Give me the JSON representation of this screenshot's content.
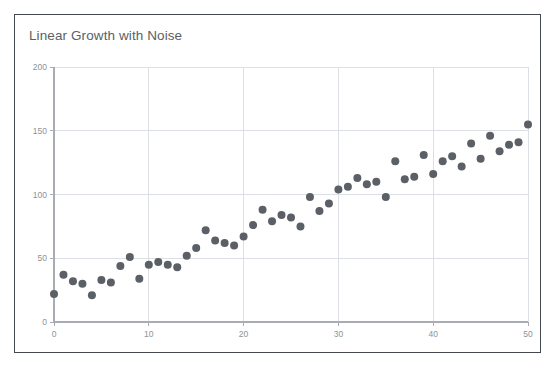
{
  "card": {
    "border_color": "#444851",
    "background": "#ffffff"
  },
  "chart_data": {
    "type": "scatter",
    "title": "Linear Growth with Noise",
    "xlabel": "",
    "ylabel": "",
    "xlim": [
      0,
      50
    ],
    "ylim": [
      0,
      200
    ],
    "grid": true,
    "legend": null,
    "marker_color": "#5b5f66",
    "marker_size": 4,
    "xticks": [
      0,
      10,
      20,
      30,
      40,
      50
    ],
    "yticks": [
      0,
      50,
      100,
      150,
      200
    ],
    "xtick_labels": [
      "0",
      "10",
      "20",
      "30",
      "40",
      "50"
    ],
    "ytick_labels": [
      "0",
      "50",
      "100",
      "150",
      "200"
    ],
    "x": [
      0,
      1,
      2,
      3,
      4,
      5,
      6,
      7,
      8,
      9,
      10,
      11,
      12,
      13,
      14,
      15,
      16,
      17,
      18,
      19,
      20,
      21,
      22,
      23,
      24,
      25,
      26,
      27,
      28,
      29,
      30,
      31,
      32,
      33,
      34,
      35,
      36,
      37,
      38,
      39,
      40,
      41,
      42,
      43,
      44,
      45,
      46,
      47,
      48,
      49,
      50
    ],
    "y": [
      22,
      37,
      32,
      30,
      21,
      33,
      31,
      44,
      51,
      34,
      45,
      47,
      45,
      43,
      52,
      58,
      72,
      64,
      62,
      60,
      67,
      76,
      88,
      79,
      84,
      82,
      75,
      98,
      87,
      93,
      104,
      106,
      113,
      108,
      110,
      98,
      126,
      112,
      114,
      131,
      116,
      126,
      130,
      122,
      140,
      128,
      146,
      134,
      139,
      141,
      155
    ]
  }
}
